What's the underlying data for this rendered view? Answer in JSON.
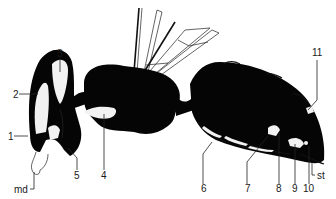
{
  "figure": {
    "colors": {
      "body": "#050505",
      "gland": "#f2f2f2",
      "background": "#ffffff",
      "line": "#222222"
    }
  },
  "labels": [
    {
      "id": "1",
      "text": "1",
      "x": 8,
      "y": 140
    },
    {
      "id": "2",
      "text": "2",
      "x": 13,
      "y": 98
    },
    {
      "id": "3",
      "text": "3",
      "x": 57,
      "y": 57
    },
    {
      "id": "4",
      "text": "4",
      "x": 101,
      "y": 179
    },
    {
      "id": "5",
      "text": "5",
      "x": 74,
      "y": 179
    },
    {
      "id": "6",
      "text": "6",
      "x": 201,
      "y": 192
    },
    {
      "id": "7",
      "text": "7",
      "x": 245,
      "y": 192
    },
    {
      "id": "8",
      "text": "8",
      "x": 276,
      "y": 192
    },
    {
      "id": "9",
      "text": "9",
      "x": 292,
      "y": 192
    },
    {
      "id": "10",
      "text": "10",
      "x": 305,
      "y": 192
    },
    {
      "id": "11",
      "text": "11",
      "x": 314,
      "y": 56
    },
    {
      "id": "md",
      "text": "md",
      "x": 18,
      "y": 193
    },
    {
      "id": "st",
      "text": "st",
      "x": 319,
      "y": 179
    }
  ]
}
